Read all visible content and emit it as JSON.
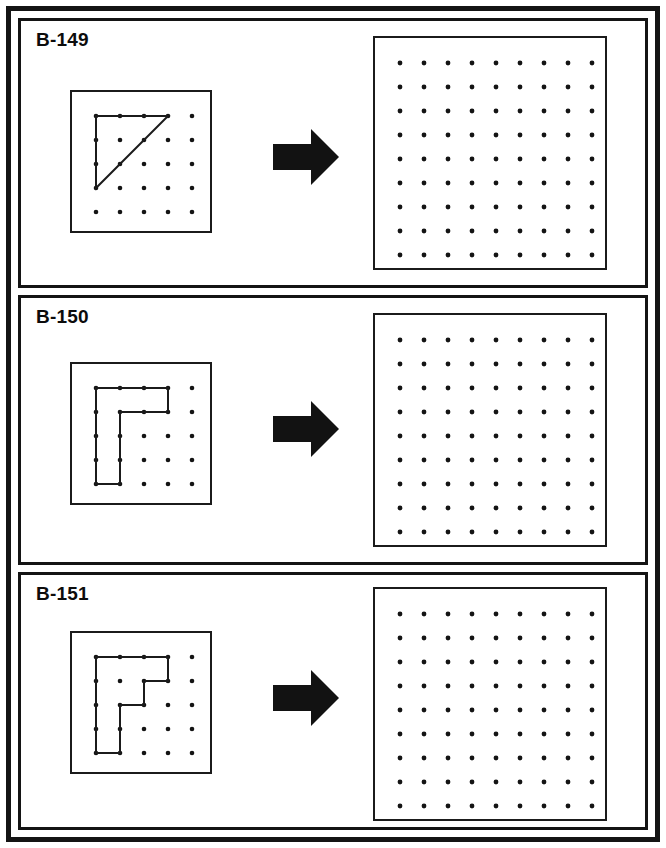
{
  "document": {
    "type": "geoboard-worksheet",
    "frame_color": "#141414",
    "ink_color": "#1b1b1b",
    "background_color": "#ffffff"
  },
  "arrow": {
    "name": "right-arrow",
    "color": "#121212",
    "direction": "right"
  },
  "boards": {
    "small": {
      "rows": 5,
      "cols": 5,
      "dot_radius": 2.3,
      "dot_color": "#141414",
      "spacing": 24,
      "origin_x": 24,
      "origin_y": 24,
      "border_color": "#1b1b1b"
    },
    "large": {
      "rows": 9,
      "cols": 9,
      "dot_radius": 2.4,
      "dot_color": "#141414",
      "spacing": 24,
      "origin_x": 25,
      "origin_y": 25,
      "border_color": "#1b1b1b"
    }
  },
  "panels": [
    {
      "id": "B-149",
      "label": "B-149",
      "figure": {
        "name": "right-triangle",
        "closed": true,
        "stroke_color": "#1b1b1b",
        "stroke_width": 2,
        "points": [
          [
            0,
            0
          ],
          [
            3,
            0
          ],
          [
            0,
            3
          ]
        ],
        "vertex_dots": [
          [
            0,
            0
          ],
          [
            3,
            0
          ],
          [
            0,
            3
          ]
        ]
      },
      "answer_board": {
        "figure": null
      }
    },
    {
      "id": "B-150",
      "label": "B-150",
      "figure": {
        "name": "l-shape",
        "closed": true,
        "stroke_color": "#1b1b1b",
        "stroke_width": 2,
        "points": [
          [
            0,
            0
          ],
          [
            3,
            0
          ],
          [
            3,
            1
          ],
          [
            1,
            1
          ],
          [
            1,
            4
          ],
          [
            0,
            4
          ]
        ],
        "vertex_dots": [
          [
            0,
            0
          ],
          [
            3,
            0
          ],
          [
            3,
            1
          ],
          [
            1,
            1
          ],
          [
            1,
            4
          ],
          [
            0,
            4
          ]
        ]
      },
      "answer_board": {
        "figure": null
      }
    },
    {
      "id": "B-151",
      "label": "B-151",
      "figure": {
        "name": "staircase-shape",
        "closed": true,
        "stroke_color": "#1b1b1b",
        "stroke_width": 2,
        "points": [
          [
            0,
            0
          ],
          [
            3,
            0
          ],
          [
            3,
            1
          ],
          [
            2,
            1
          ],
          [
            2,
            2
          ],
          [
            1,
            2
          ],
          [
            1,
            4
          ],
          [
            0,
            4
          ]
        ],
        "vertex_dots": [
          [
            0,
            0
          ],
          [
            3,
            0
          ],
          [
            3,
            1
          ],
          [
            2,
            1
          ],
          [
            2,
            2
          ],
          [
            1,
            2
          ],
          [
            1,
            4
          ],
          [
            0,
            4
          ]
        ]
      },
      "answer_board": {
        "figure": null
      }
    }
  ]
}
